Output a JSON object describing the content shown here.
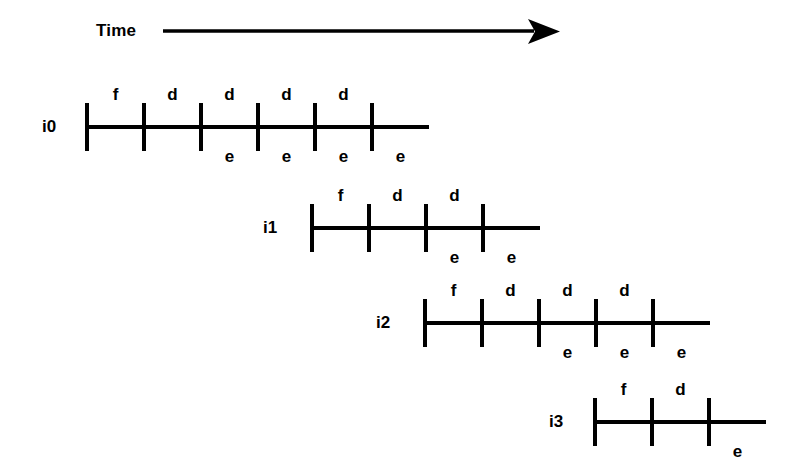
{
  "diagram": {
    "title_axis": {
      "label": "Time",
      "arrow_icon": "right-arrow-icon",
      "direction": "left-to-right"
    },
    "background_color": "#ffffff",
    "line_color": "#000000",
    "stage_legend": {
      "f": "fetch",
      "d": "decode",
      "e": "execute"
    },
    "rows": [
      {
        "id": "i0",
        "label": "i0",
        "tick_count": 6,
        "above_labels": [
          "f",
          "d",
          "d",
          "d",
          "d"
        ],
        "below_labels": [
          "",
          "",
          "e",
          "e",
          "e",
          "e"
        ]
      },
      {
        "id": "i1",
        "label": "i1",
        "tick_count": 4,
        "above_labels": [
          "f",
          "d",
          "d"
        ],
        "below_labels": [
          "",
          "",
          "e",
          "e"
        ]
      },
      {
        "id": "i2",
        "label": "i2",
        "tick_count": 5,
        "above_labels": [
          "f",
          "d",
          "d",
          "d"
        ],
        "below_labels": [
          "",
          "",
          "e",
          "e",
          "e"
        ]
      },
      {
        "id": "i3",
        "label": "i3",
        "tick_count": 3,
        "above_labels": [
          "f",
          "d"
        ],
        "below_labels": [
          "",
          "",
          "e"
        ]
      }
    ]
  },
  "chart_data": {
    "type": "table",
    "title": "Time",
    "xlabel": "Time",
    "ylabel": "",
    "grid": false,
    "legend": "none",
    "categories": [
      "i0",
      "i1",
      "i2",
      "i3"
    ],
    "series": [
      {
        "name": "i0",
        "start_slot": 0,
        "above": [
          "f",
          "d",
          "d",
          "d",
          "d"
        ],
        "below": [
          "",
          "",
          "e",
          "e",
          "e",
          "e"
        ],
        "ticks": 6
      },
      {
        "name": "i1",
        "start_slot": 4,
        "above": [
          "f",
          "d",
          "d"
        ],
        "below": [
          "",
          "",
          "e",
          "e"
        ],
        "ticks": 4
      },
      {
        "name": "i2",
        "start_slot": 6,
        "above": [
          "f",
          "d",
          "d",
          "d"
        ],
        "below": [
          "",
          "",
          "e",
          "e",
          "e"
        ],
        "ticks": 5
      },
      {
        "name": "i3",
        "start_slot": 9,
        "above": [
          "f",
          "d"
        ],
        "below": [
          "",
          "",
          "e"
        ],
        "ticks": 3
      }
    ]
  },
  "layout": {
    "slot_width": 57,
    "tick_half_height": 24,
    "line_thickness": 4,
    "tick_thickness": 4,
    "rows_geometry": [
      {
        "label_x": 42,
        "start_x": 87,
        "line_y": 127,
        "end_x": 429
      },
      {
        "label_x": 263,
        "start_x": 312,
        "line_y": 228,
        "end_x": 540
      },
      {
        "label_x": 376,
        "start_x": 425,
        "line_y": 323,
        "end_x": 710
      },
      {
        "label_x": 549,
        "start_x": 595,
        "line_y": 422,
        "end_x": 766
      }
    ],
    "axis_geometry": {
      "text_x": 96,
      "text_y": 22,
      "line_x1": 163,
      "line_x2": 532,
      "line_y": 31,
      "head_tip_x": 557
    }
  }
}
